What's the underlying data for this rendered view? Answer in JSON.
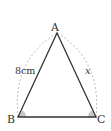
{
  "diagram": {
    "type": "isosceles-triangle",
    "vertices": {
      "A": {
        "label": "A"
      },
      "B": {
        "label": "B"
      },
      "C": {
        "label": "C"
      }
    },
    "sides": {
      "AB": {
        "label": "8cm"
      },
      "AC": {
        "label": "x"
      }
    },
    "marked_equal_angles": [
      "B",
      "C"
    ],
    "colors": {
      "stroke": "#333333",
      "arc": "#aaaaaa",
      "angle_fill": "#c8c8c8"
    }
  }
}
